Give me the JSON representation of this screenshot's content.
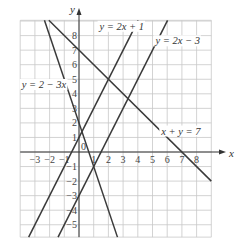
{
  "chart_data": {
    "type": "line",
    "title": "",
    "xlabel": "x",
    "ylabel": "y",
    "xlim": [
      -4,
      9
    ],
    "ylim": [
      -6,
      9
    ],
    "grid": true,
    "x_ticks": [
      -3,
      -2,
      -1,
      1,
      2,
      3,
      4,
      5,
      6,
      7,
      8
    ],
    "y_ticks": [
      -5,
      -4,
      -3,
      -2,
      -1,
      1,
      2,
      3,
      4,
      5,
      6,
      7,
      8
    ],
    "origin_label": "0",
    "series": [
      {
        "name": "y = 2x + 1",
        "slope": 2,
        "intercept": 1,
        "label": "y = 2x + 1"
      },
      {
        "name": "y = 2x − 3",
        "slope": 2,
        "intercept": -3,
        "label": "y = 2x − 3"
      },
      {
        "name": "y = 2 − 3x",
        "slope": -3,
        "intercept": 2,
        "label": "y = 2 − 3x"
      },
      {
        "name": "x + y = 7",
        "slope": -1,
        "intercept": 7,
        "label": "x + y = 7"
      }
    ],
    "annotations": [
      {
        "text": "y = 2x + 1",
        "x": 1.4,
        "y": 8.4
      },
      {
        "text": "y = 2x − 3",
        "x": 5.2,
        "y": 7.4
      },
      {
        "text": "y = 2 − 3x",
        "x": -3.9,
        "y": 4.4
      },
      {
        "text": "x + y = 7",
        "x": 5.6,
        "y": 1.2
      }
    ]
  },
  "axes": {
    "x_label": "x",
    "y_label": "y",
    "origin": "0"
  },
  "colors": {
    "grid": "#c8c8c8",
    "line": "#3a3a3a",
    "text": "#333333",
    "background": "#ffffff"
  }
}
